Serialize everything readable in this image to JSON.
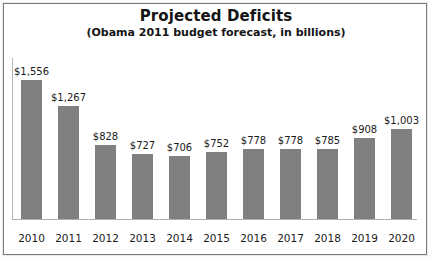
{
  "chart_data": {
    "type": "bar",
    "title": "Projected Deficits",
    "subtitle": "(Obama 2011 budget forecast, in billions)",
    "xlabel": "",
    "ylabel": "",
    "ylim": [
      0,
      1800
    ],
    "grid": false,
    "legend": "none",
    "axis": {
      "x_line": true,
      "y_line": true,
      "y_ticks_visible": false
    },
    "categories": [
      "2010",
      "2011",
      "2012",
      "2013",
      "2014",
      "2015",
      "2016",
      "2017",
      "2018",
      "2019",
      "2020"
    ],
    "values": [
      1556,
      1267,
      828,
      727,
      706,
      752,
      778,
      778,
      785,
      908,
      1003
    ],
    "value_labels": [
      "$1,556",
      "$1,267",
      "$828",
      "$727",
      "$706",
      "$752",
      "$778",
      "$778",
      "$785",
      "$908",
      "$1,003"
    ],
    "colors": {
      "bar": "#808080",
      "plot_background": "#ffffff",
      "frame": "#777b7e",
      "text": "#1b1b1b"
    }
  }
}
